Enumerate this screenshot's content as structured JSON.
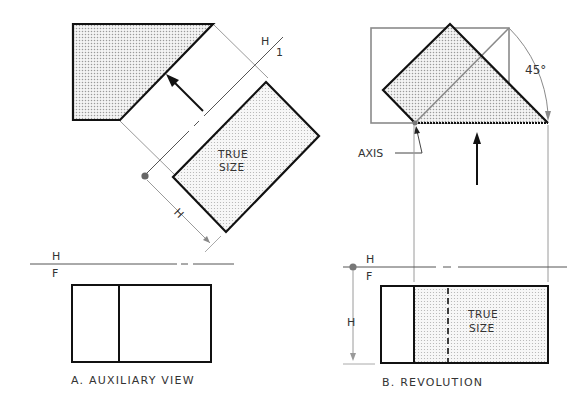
{
  "figure": {
    "panel_a": {
      "caption": "A. AUXILIARY VIEW",
      "true_size_label_line1": "TRUE",
      "true_size_label_line2": "SIZE",
      "fold_line_top": "H",
      "fold_line_aux": "1",
      "fold_line_hf_top": "H",
      "fold_line_hf_bottom": "F",
      "dimension_label": "H"
    },
    "panel_b": {
      "caption": "B. REVOLUTION",
      "angle_label": "45°",
      "axis_label": "AXIS",
      "true_size_label_line1": "TRUE",
      "true_size_label_line2": "SIZE",
      "fold_line_hf_top": "H",
      "fold_line_hf_bottom": "F",
      "dimension_label": "H"
    }
  },
  "colors": {
    "outline": "#111111",
    "construction": "#8a8a8a",
    "shade_dot": "#9a9a9a"
  }
}
